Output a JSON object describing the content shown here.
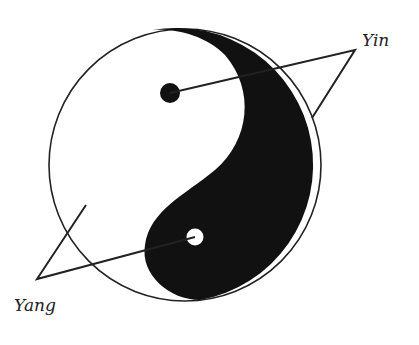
{
  "diagram": {
    "title": "",
    "labels": {
      "yin": "Yin",
      "yang": "Yang"
    },
    "colors": {
      "ink": "#111111",
      "paper": "#ffffff",
      "line": "#222222"
    },
    "symbol": "yin-yang"
  }
}
